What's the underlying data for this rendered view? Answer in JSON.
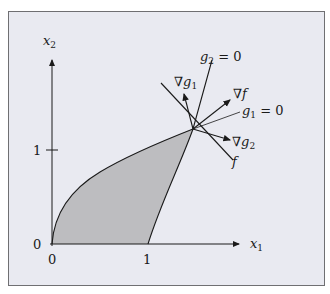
{
  "diagram": {
    "axes": {
      "x_label": "x",
      "x_sub": "1",
      "y_label": "x",
      "y_sub": "2",
      "x_ticks": [
        "0",
        "1"
      ],
      "y_ticks": [
        "0",
        "1"
      ]
    },
    "lines": {
      "g2_label_main": "g",
      "g2_label_sub": "2",
      "g2_label_eq": " = 0",
      "g1_label_main": "g",
      "g1_label_sub": "1",
      "g1_label_eq": " = 0",
      "f_label": "f"
    },
    "gradients": {
      "grad_g1_main": "∇g",
      "grad_g1_sub": "1",
      "grad_f": "∇f",
      "grad_g2_main": "∇g",
      "grad_g2_sub": "2"
    },
    "colors": {
      "background": "#e9eaf1",
      "feasible_region": "#bdbdc0",
      "stroke": "#1a1a1a"
    }
  }
}
